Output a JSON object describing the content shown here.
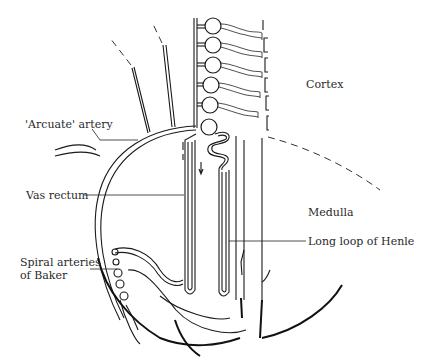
{
  "figure": {
    "labels": {
      "cortex": "Cortex",
      "medulla": "Medulla",
      "arcuate_artery": "'Arcuate' artery",
      "vas_rectum": "Vas rectum",
      "long_loop_henle": "Long loop of Henle",
      "spiral_arteries_line1": "Spiral arteries",
      "spiral_arteries_line2": "of Baker"
    },
    "structures": {
      "glomeruli_count": 6,
      "regions": [
        "Cortex",
        "Medulla"
      ],
      "cortico_medullary_boundary": "dashed-line"
    },
    "colors": {
      "line": "#1a1a1a",
      "text": "#2a2a2a",
      "background": "#ffffff"
    }
  }
}
